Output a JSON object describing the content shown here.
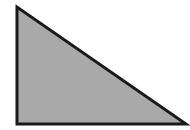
{
  "diagram": {
    "type": "right-triangle",
    "canvas": {
      "width": 190,
      "height": 130,
      "background": "#ffffff"
    },
    "shape": {
      "vertices": [
        {
          "name": "top",
          "x": 17,
          "y": 7
        },
        {
          "name": "bottom-left",
          "x": 17,
          "y": 124
        },
        {
          "name": "bottom-right",
          "x": 186,
          "y": 124
        }
      ],
      "fill": "#a9a9a9",
      "stroke": "#1a1a1a",
      "stroke_width": 3,
      "right_angle_at": "bottom-left"
    }
  }
}
